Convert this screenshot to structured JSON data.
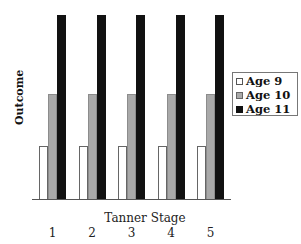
{
  "chart_data": {
    "type": "bar",
    "title": "",
    "xlabel": "Tanner Stage",
    "ylabel": "Outcome",
    "categories": [
      "1",
      "2",
      "3",
      "4",
      "5"
    ],
    "series": [
      {
        "name": "Age 9",
        "color": "#ffffff",
        "values": [
          1.0,
          1.0,
          1.0,
          1.0,
          1.0
        ]
      },
      {
        "name": "Age 10",
        "color": "#a9a9a9",
        "values": [
          2.0,
          2.0,
          2.0,
          2.0,
          2.0
        ]
      },
      {
        "name": "Age 11",
        "color": "#111111",
        "values": [
          3.5,
          3.5,
          3.5,
          3.5,
          3.5
        ]
      }
    ],
    "ylim": [
      0,
      3.5
    ],
    "y_ticks_shown": false,
    "grid": false,
    "legend_position": "right"
  }
}
